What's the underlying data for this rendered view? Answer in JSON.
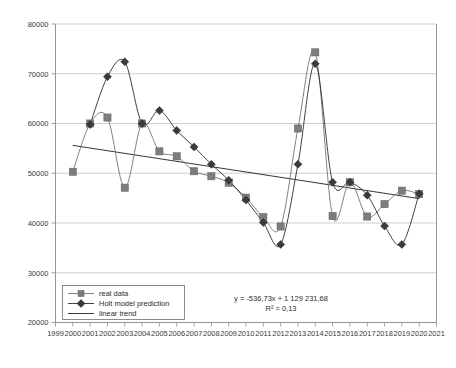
{
  "chart_data": {
    "type": "line",
    "title": "",
    "subtitle": "",
    "xlabel": "",
    "ylabel": "",
    "xlim": [
      1999,
      2021
    ],
    "ylim": [
      20000,
      80000
    ],
    "ytick_step": 10000,
    "grid": true,
    "legend_position": "bottom-left",
    "x_ticks": [
      "1999",
      "2000",
      "2001",
      "2002",
      "2003",
      "2004",
      "2005",
      "2006",
      "2007",
      "2008",
      "2009",
      "2010",
      "2011",
      "2012",
      "2013",
      "2014",
      "2015",
      "2016",
      "2017",
      "2018",
      "2019",
      "2020",
      "2021"
    ],
    "y_ticks": [
      "20000",
      "30000",
      "40000",
      "50000",
      "60000",
      "70000",
      "80000"
    ],
    "series": [
      {
        "name": "real data",
        "marker": "square",
        "color": "#7d7d7d",
        "x": [
          2000,
          2001,
          2002,
          2003,
          2004,
          2005,
          2006,
          2007,
          2008,
          2009,
          2010,
          2011,
          2012,
          2013,
          2014,
          2015,
          2016,
          2017,
          2018,
          2019,
          2020
        ],
        "values": [
          50300,
          60000,
          61200,
          47100,
          60000,
          54400,
          53400,
          50400,
          49400,
          48100,
          45100,
          41200,
          39300,
          59000,
          74300,
          41400,
          48200,
          41300,
          43800,
          46500,
          45800
        ]
      },
      {
        "name": "Holt model prediction",
        "marker": "diamond",
        "color": "#3b3b3b",
        "x": [
          2001,
          2002,
          2003,
          2004,
          2005,
          2006,
          2007,
          2008,
          2009,
          2010,
          2011,
          2012,
          2013,
          2014,
          2015,
          2016,
          2017,
          2018,
          2019,
          2020
        ],
        "values": [
          59800,
          69400,
          72400,
          60000,
          62600,
          58600,
          55300,
          51800,
          48600,
          44600,
          40100,
          35700,
          51800,
          72000,
          48200,
          48200,
          45600,
          39400,
          35700,
          45900
        ]
      },
      {
        "name": "linear trend",
        "marker": "none",
        "color": "#1f1f1f",
        "x": [
          2000,
          2020
        ],
        "values": [
          55600,
          44900
        ]
      }
    ],
    "annotations": {
      "equation": "y = -536,73x + 1 129 231,68",
      "r_squared": "R² = 0,13"
    }
  },
  "legend": {
    "items": [
      {
        "label": "real data"
      },
      {
        "label": "Holt model prediction"
      },
      {
        "label": "linear trend"
      }
    ]
  }
}
